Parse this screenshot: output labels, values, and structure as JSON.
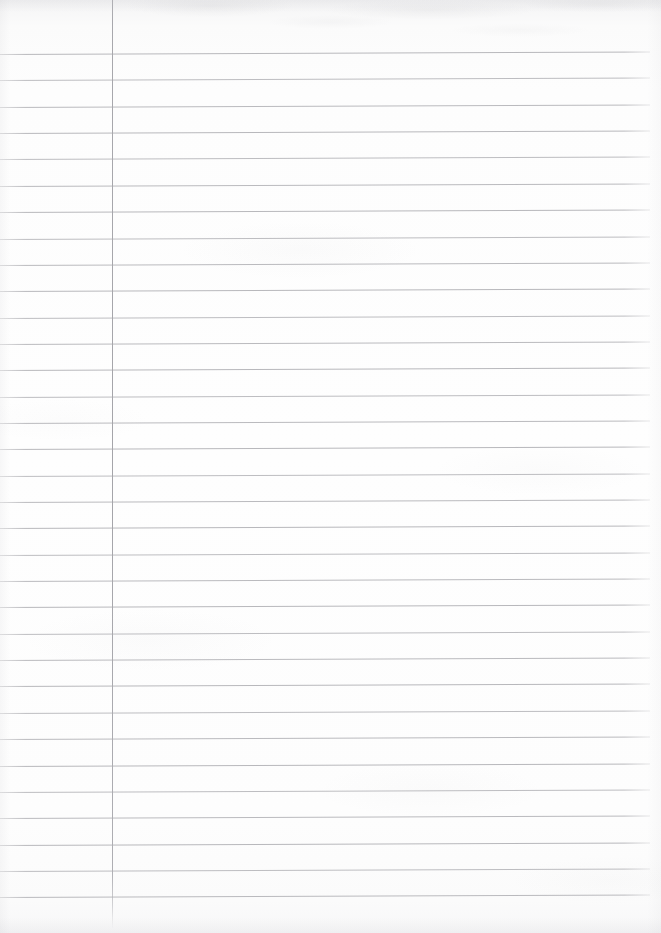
{
  "document": {
    "kind": "scanned-lined-notebook-page",
    "title": "Blank lined notebook page",
    "content_text": "",
    "page_width": 661,
    "page_height": 933,
    "background_color": "#fdfdfd",
    "is_blank": "true",
    "handwriting": "none",
    "printed_text": "none"
  },
  "ruling": {
    "style": "single-margin college ruled",
    "line_color": "#b4b4b8",
    "margin_rule_color": "#a8a8ad",
    "line_count": 33,
    "first_line_y": 54,
    "line_spacing": 26.35,
    "line_start_x": 0,
    "line_end_x": 650,
    "slant_px_over_width": -2.4,
    "margin_rule_x": 112,
    "margin_rule_top_y": 0,
    "margin_rule_bottom_y": 928,
    "line_y_positions": [
      54,
      80.4,
      106.7,
      133.1,
      159.4,
      185.8,
      212.1,
      238.5,
      264.8,
      291.2,
      317.5,
      343.9,
      370.2,
      396.6,
      422.9,
      449.3,
      475.6,
      502.0,
      528.3,
      554.7,
      581.0,
      607.4,
      633.7,
      660.1,
      686.4,
      712.8,
      739.1,
      765.5,
      791.8,
      818.2,
      844.5,
      870.9,
      897.2
    ]
  },
  "scan_artifacts": {
    "top_shadow": "light grey mottling along the top edge",
    "edge_shading": "soft grey falloff on all four edges",
    "paper_texture": "faint irregular light-grey blotches"
  }
}
